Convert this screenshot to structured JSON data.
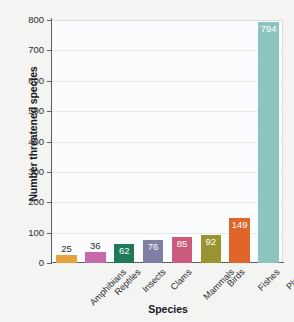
{
  "chart_data": {
    "type": "bar",
    "title": "",
    "xlabel": "Species",
    "ylabel": "Number threatened species",
    "categories": [
      "Amphibians",
      "Reptiles",
      "Insects",
      "Clams",
      "Mammals",
      "Birds",
      "Fishes",
      "Plants"
    ],
    "values": [
      25,
      36,
      62,
      76,
      85,
      92,
      149,
      794
    ],
    "ylim": [
      0,
      800
    ],
    "yticks": [
      0,
      100,
      200,
      300,
      400,
      500,
      600,
      700,
      800
    ],
    "ytick_labels": [
      "0",
      "100",
      "200",
      "300",
      "400",
      "500",
      "600",
      "700",
      "800"
    ],
    "grid": true,
    "legend": false,
    "bar_colors": [
      "#e9a13b",
      "#c островок"
    ],
    "colors": {
      "Amphibians": "#e6a23c",
      "Reptiles": "#c46aab",
      "Insects": "#1f7a5a",
      "Clams": "#7f7fa3",
      "Mammals": "#cc5b7d",
      "Birds": "#9a9430",
      "Fishes": "#e0652a",
      "Plants": "#8ec4bf"
    },
    "label_placement": [
      "outside",
      "outside",
      "inside",
      "inside",
      "inside",
      "inside",
      "inside",
      "inside"
    ],
    "plot_background": "#fbfcfd",
    "page_background": "#f4f4f3",
    "axis_color": "#5b6066",
    "gridline_color": "#e4e9ee"
  }
}
